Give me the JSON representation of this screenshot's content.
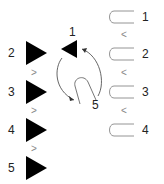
{
  "diagram": {
    "left_sequence": {
      "items": [
        {
          "label": "2",
          "shape": "triangle-right",
          "color": "#000000"
        },
        {
          "label": "3",
          "shape": "triangle-right",
          "color": "#000000"
        },
        {
          "label": "4",
          "shape": "triangle-right",
          "color": "#000000"
        },
        {
          "label": "5",
          "shape": "triangle-right",
          "color": "#000000"
        }
      ],
      "separator": ">"
    },
    "rotation": {
      "start_label": "1",
      "start_shape": "triangle-left",
      "end_label": "5",
      "arrow": "circular-rotation-arrows",
      "center_shape": "u-shape-rotated"
    },
    "right_sequence": {
      "items": [
        {
          "label": "1",
          "shape": "u-bracket-left"
        },
        {
          "label": "2",
          "shape": "u-bracket-left"
        },
        {
          "label": "3",
          "shape": "u-bracket-left"
        },
        {
          "label": "4",
          "shape": "u-bracket-left"
        }
      ],
      "separator": "<"
    }
  }
}
